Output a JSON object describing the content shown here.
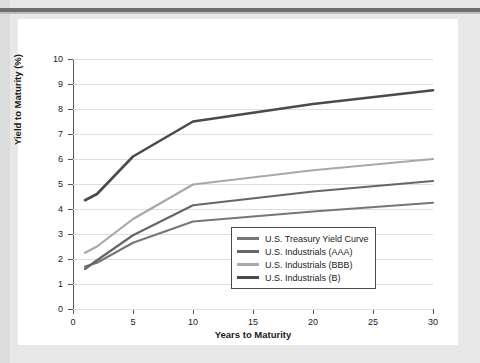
{
  "figure": {
    "background_color": "#ffffff",
    "page_background_color": "#e8e8e8",
    "rule_color": "#6e6e6e"
  },
  "chart_data": {
    "type": "line",
    "title": "",
    "xlabel": "Years to Maturity",
    "ylabel": "Yield to Maturity (%)",
    "xlim": [
      0,
      30
    ],
    "ylim": [
      0,
      10
    ],
    "xticks": [
      0,
      5,
      10,
      15,
      20,
      25,
      30
    ],
    "yticks": [
      0,
      1,
      2,
      3,
      4,
      5,
      6,
      7,
      8,
      9,
      10
    ],
    "grid": "horizontal",
    "legend_position": "lower right",
    "x": [
      1,
      2,
      5,
      10,
      20,
      30
    ],
    "series": [
      {
        "name": "U.S. Treasury Yield Curve",
        "color": "#777777",
        "width": 2.2,
        "values": [
          1.7,
          1.85,
          2.65,
          3.5,
          3.9,
          4.25
        ]
      },
      {
        "name": "U.S. Industrials (AAA)",
        "color": "#666666",
        "width": 2.2,
        "values": [
          1.6,
          1.95,
          2.95,
          4.15,
          4.7,
          5.12
        ]
      },
      {
        "name": "U.S. Industrials (BBB)",
        "color": "#a8a8a8",
        "width": 2.2,
        "values": [
          2.25,
          2.5,
          3.6,
          4.98,
          5.55,
          6.0
        ]
      },
      {
        "name": "U.S. Industrials (B)",
        "color": "#4a4a4a",
        "width": 2.6,
        "values": [
          4.35,
          4.6,
          6.1,
          7.5,
          8.2,
          8.75
        ]
      }
    ]
  },
  "legend": {
    "items": [
      {
        "label": "U.S. Treasury Yield Curve",
        "color": "#777777"
      },
      {
        "label": "U.S. Industrials (AAA)",
        "color": "#666666"
      },
      {
        "label": "U.S. Industrials (BBB)",
        "color": "#a8a8a8"
      },
      {
        "label": "U.S. Industrials (B)",
        "color": "#4a4a4a"
      }
    ]
  }
}
